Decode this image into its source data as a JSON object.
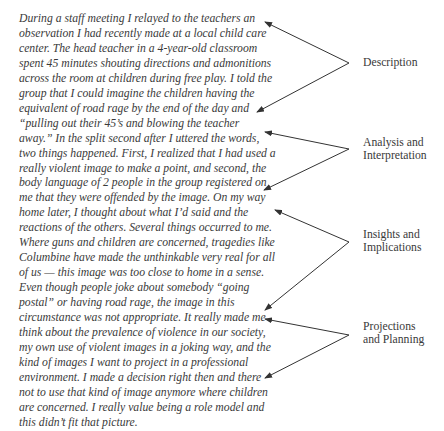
{
  "passage": {
    "lines": [
      "During a staff meeting I relayed to the teachers an",
      "observation I had recently made at a local child care",
      "center. The head teacher in a 4-year-old classroom",
      "spent 45 minutes shouting directions and admonitions",
      "across the room at children during free play. I told the",
      "group that I could imagine the children having the",
      "equivalent of road rage by the end of the day and",
      "“pulling out their 45’s and blowing the teacher",
      "away.”  In the split second after I uttered the words,",
      "two things happened. First, I realized that I had used a",
      "really violent image to make a point, and second, the",
      "body language of 2 people in the group registered on",
      "me that they were offended by the image. On my way",
      "home later, I thought about what I’d said and the",
      "reactions of the others. Several things occurred to me.",
      "Where guns and children are concerned, tragedies like",
      "Columbine have made the unthinkable very real for all",
      "of us — this image was too close to home in a sense.",
      "Even though people joke about somebody “going",
      "postal” or having road rage, the image in this",
      "circumstance was not appropriate. It really made me",
      "think about the prevalence of violence in our society,",
      "my own use of violent images in a joking way, and the",
      "kind of images I want to project in a professional",
      "environment. I made a decision right then and there",
      "not to use that kind of image anymore where children",
      "are concerned. I really value being a role model and",
      "this didn’t fit that picture."
    ]
  },
  "labels": {
    "description": [
      "Description"
    ],
    "analysis": [
      "Analysis and",
      "Interpretation"
    ],
    "insights": [
      "Insights and",
      "Implications"
    ],
    "projections": [
      "Projections",
      "and Planning"
    ]
  },
  "colors": {
    "text": "#3a3a3a",
    "arrow": "#333333"
  }
}
